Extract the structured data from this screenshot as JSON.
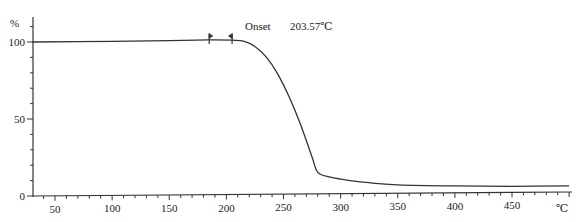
{
  "chart_data": {
    "type": "line",
    "title": "",
    "xlabel": "℃",
    "ylabel": "%",
    "xlim": [
      30,
      500
    ],
    "ylim": [
      0,
      100
    ],
    "x_ticks": [
      50,
      100,
      150,
      200,
      250,
      300,
      350,
      400,
      450
    ],
    "y_ticks": [
      0,
      50,
      100
    ],
    "grid": false,
    "legend": null,
    "series": [
      {
        "name": "TGA mass %",
        "x": [
          30,
          100,
          150,
          185,
          205,
          215,
          225,
          235,
          245,
          255,
          265,
          275,
          280,
          290,
          300,
          325,
          350,
          400,
          450,
          500
        ],
        "y": [
          100,
          100,
          100.3,
          100.5,
          100.2,
          99.5,
          96,
          89,
          78,
          63,
          45,
          24,
          14,
          11,
          9.5,
          7,
          5.5,
          4.5,
          4,
          4
        ]
      }
    ],
    "annotations": [
      {
        "text": "Onset",
        "value": "203.57℃",
        "x": 203.57
      },
      {
        "type": "marker",
        "x": 185,
        "y": 100.5
      },
      {
        "type": "marker",
        "x": 205,
        "y": 100.3
      }
    ]
  },
  "labels": {
    "y_unit": "%",
    "x_unit": "℃",
    "onset_label": "Onset",
    "onset_value": "203.57℃",
    "x_tick_labels": [
      "50",
      "100",
      "150",
      "200",
      "250",
      "300",
      "350",
      "400",
      "450"
    ],
    "y_tick_labels": [
      "0",
      "50",
      "100"
    ]
  }
}
